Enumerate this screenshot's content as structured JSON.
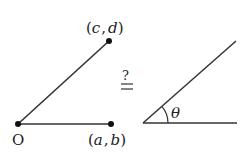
{
  "left_figure": {
    "origin_label": "O",
    "point_a_label": "(a, b)",
    "point_c_label": "(c, d)",
    "point_a_parts": {
      "open": "(",
      "x": "a",
      "sep": ",",
      "y": "b",
      "close": ")"
    },
    "point_c_parts": {
      "open": "(",
      "x": "c",
      "sep": ",",
      "y": "d",
      "close": ")"
    }
  },
  "relation": {
    "symbol_top": "?",
    "symbol_bottom": "="
  },
  "right_figure": {
    "angle_label": "θ"
  },
  "colors": {
    "stroke": "#333333",
    "background": "#ffffff"
  }
}
